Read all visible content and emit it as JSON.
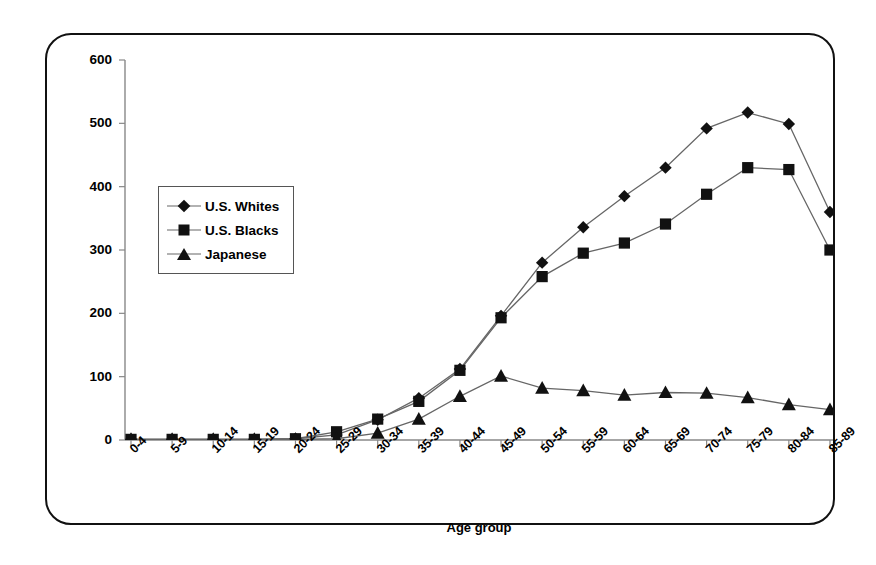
{
  "chart_data": {
    "type": "line",
    "title": "",
    "xlabel": "Age group",
    "ylabel": "Incidence rate per 100,000",
    "categories": [
      "0-4",
      "5-9",
      "10-14",
      "15-19",
      "20-24",
      "25-29",
      "30-34",
      "35-39",
      "40-44",
      "45-49",
      "50-54",
      "55-59",
      "60-64",
      "65-69",
      "70-74",
      "75-79",
      "80-84",
      "85-89"
    ],
    "ylim": [
      0,
      600
    ],
    "yticks": [
      0,
      100,
      200,
      300,
      400,
      500,
      600
    ],
    "grid": false,
    "legend_position": "inside-upper-left",
    "series": [
      {
        "name": "U.S. Whites",
        "marker": "diamond",
        "values": [
          1,
          1,
          1,
          1,
          2,
          8,
          32,
          66,
          112,
          196,
          280,
          336,
          385,
          430,
          492,
          517,
          499,
          360
        ]
      },
      {
        "name": "U.S. Blacks",
        "marker": "square",
        "values": [
          1,
          1,
          1,
          1,
          2,
          13,
          33,
          61,
          110,
          193,
          258,
          295,
          311,
          341,
          388,
          430,
          427,
          300
        ]
      },
      {
        "name": "Japanese",
        "marker": "triangle",
        "values": [
          1,
          1,
          1,
          1,
          1,
          2,
          11,
          33,
          69,
          101,
          82,
          78,
          71,
          75,
          74,
          67,
          56,
          48
        ]
      }
    ]
  },
  "axes": {
    "y_tick_labels": [
      "600",
      "500",
      "400",
      "300",
      "200",
      "100",
      "0"
    ],
    "y_title": "Incidence rate per 100,000",
    "x_title": "Age group",
    "x_tick_labels": [
      "0-4",
      "5-9",
      "10-14",
      "15-19",
      "20-24",
      "25-29",
      "30-34",
      "35-39",
      "40-44",
      "45-49",
      "50-54",
      "55-59",
      "60-64",
      "65-69",
      "70-74",
      "75-79",
      "80-84",
      "85-89"
    ]
  },
  "legend": {
    "items": [
      {
        "label": "U.S. Whites",
        "marker": "diamond-marker"
      },
      {
        "label": "U.S. Blacks",
        "marker": "square-marker"
      },
      {
        "label": "Japanese",
        "marker": "triangle-marker"
      }
    ]
  },
  "colors": {
    "series_marker": "#111111",
    "series_line": "#666666",
    "axis": "#888888",
    "frame": "#111111",
    "background": "#ffffff"
  }
}
